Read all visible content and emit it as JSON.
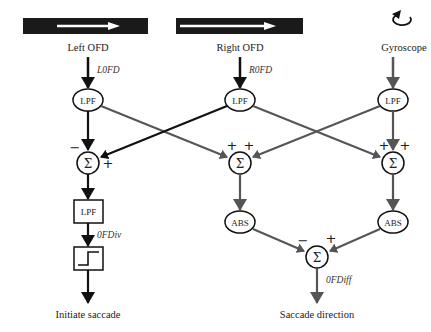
{
  "inputs": {
    "left": {
      "label": "Left OFD",
      "signal": "L0FD"
    },
    "right": {
      "label": "Right OFD",
      "signal": "R0FD"
    },
    "gyro": {
      "label": "Gyroscope"
    }
  },
  "nodes": {
    "lpf": "LPF",
    "sigma": "Σ",
    "abs": "ABS"
  },
  "signs": {
    "left_sum": [
      "−",
      "+"
    ],
    "mid_sum": [
      "+",
      "+"
    ],
    "right_sum": [
      "+",
      "+"
    ],
    "out_sum": [
      "−",
      "+"
    ]
  },
  "signals": {
    "ofdiv": "0FDiv",
    "ofdiff": "0FDiff"
  },
  "outputs": {
    "left": "Initiate saccade",
    "right": "Saccade direction"
  },
  "colors": {
    "black": "#111111",
    "gray": "#555555",
    "bar": "#1a1a1a",
    "arrow_white": "#ffffff"
  }
}
